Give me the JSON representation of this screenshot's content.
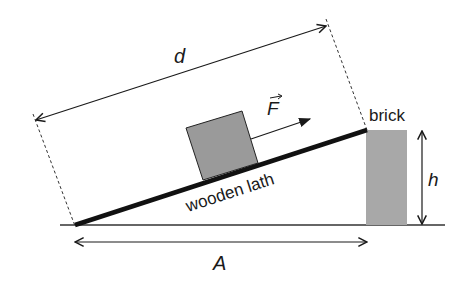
{
  "diagram": {
    "type": "inclined-plane-physics",
    "labels": {
      "distance": "d",
      "force": "F",
      "brick": "brick",
      "height": "h",
      "lath": "wooden lath",
      "base": "A"
    },
    "colors": {
      "ink": "#1a1a1a",
      "block_fill": "#9a9a9a",
      "brick_fill": "#a8a8a8",
      "background": "#ffffff"
    }
  }
}
